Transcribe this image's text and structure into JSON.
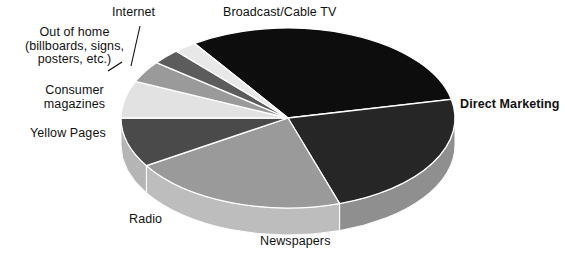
{
  "chart_data": {
    "type": "pie",
    "title": "",
    "subtitle": "",
    "xlabel": "",
    "ylabel": "",
    "legend_position": "none",
    "grid": false,
    "three_d": true,
    "categories": [
      "Broadcast/Cable TV",
      "Direct Marketing",
      "Newspapers",
      "Radio",
      "Yellow Pages",
      "Consumer magazines",
      "Out of home (billboards, signs, posters, etc.)",
      "Internet"
    ],
    "values": [
      28,
      21,
      19,
      8,
      6,
      6,
      5,
      7
    ],
    "slices": [
      {
        "label": "Broadcast/Cable TV",
        "value": 28,
        "color": "#0d0d0d",
        "side_color": "#cfcfcf",
        "start_angle": 236,
        "end_angle": 348
      },
      {
        "label": "Direct Marketing",
        "value": 21,
        "color": "#262626",
        "side_color": "#8f8f8f",
        "start_angle": 348,
        "end_angle": 432
      },
      {
        "label": "Newspapers",
        "value": 19,
        "color": "#9a9a9a",
        "side_color": "#bdbdbd",
        "start_angle": 72,
        "end_angle": 148
      },
      {
        "label": "Radio",
        "value": 8,
        "color": "#4a4a4a",
        "side_color": "#b5b5b5",
        "start_angle": 148,
        "end_angle": 180
      },
      {
        "label": "Yellow Pages",
        "value": 6,
        "color": "#e2e2e2",
        "side_color": "#c9c9c9",
        "start_angle": 180,
        "end_angle": 204
      },
      {
        "label": "Consumer magazines",
        "value": 6,
        "color": "#9a9a9a",
        "side_color": "#bdbdbd",
        "start_angle": 204,
        "end_angle": 218
      },
      {
        "label": "Out of home (billboards, signs, posters, etc.)",
        "value": 5,
        "color": "#5c5c5c",
        "side_color": "#a8a8a8",
        "start_angle": 218,
        "end_angle": 228
      },
      {
        "label": "Internet",
        "value": 7,
        "color": "#e8e8e8",
        "side_color": "#cccccc",
        "start_angle": 228,
        "end_angle": 236
      }
    ]
  },
  "labels": {
    "broadcast": "Broadcast/Cable TV",
    "internet": "Internet",
    "out_of_home": "Out of home (billboards, signs, posters, etc.)",
    "consumer_magazines": "Consumer magazines",
    "yellow_pages": "Yellow Pages",
    "radio": "Radio",
    "newspapers": "Newspapers",
    "direct_marketing": "Direct Marketing"
  },
  "colors": {
    "background": "#ffffff",
    "text": "#111111",
    "slice_outline": "#ffffff"
  }
}
